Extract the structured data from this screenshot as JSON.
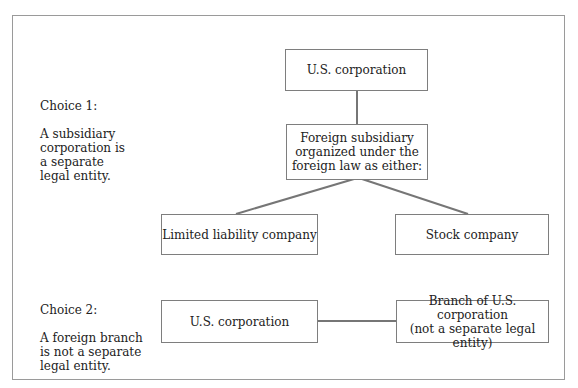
{
  "choices": [
    {
      "label": "Choice 1:",
      "text": "A subsidiary\ncorporation is\na separate\nlegal entity."
    },
    {
      "label": "Choice 2:",
      "text": "A foreign branch\nis not a separate\nlegal entity."
    }
  ],
  "choice1_diagram": {
    "parent": "U.S. corporation",
    "subsidiary": "Foreign subsidiary\norganized under the\nforeign law as either:",
    "options": [
      "Limited liability company",
      "Stock company"
    ]
  },
  "choice2_diagram": {
    "parent": "U.S. corporation",
    "branch": "Branch of U.S. corporation\n(not a separate legal entity)"
  },
  "colors": {
    "text": "#222222",
    "box_border": "#7e7e7e",
    "connector": "#767676",
    "frame": "#9a9a9a"
  }
}
